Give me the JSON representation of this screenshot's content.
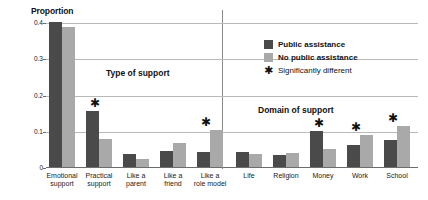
{
  "chart_data": {
    "type": "bar",
    "title": "",
    "xlabel": "",
    "ylabel": "Proportion",
    "ylim": [
      0,
      0.4
    ],
    "yticks": [
      "0",
      "0.1",
      "0.2",
      "0.3",
      "0.4"
    ],
    "ytick_values": [
      0,
      0.1,
      0.2,
      0.3,
      0.4
    ],
    "grid": true,
    "legend_position": "top-right",
    "categories": [
      "Emotional support",
      "Practical support",
      "Like a parent",
      "Like a friend",
      "Like a role model",
      "Life",
      "Religion",
      "Money",
      "Work",
      "School"
    ],
    "category_lines": [
      [
        "Emotional",
        "support"
      ],
      [
        "Practical",
        "support"
      ],
      [
        "Like a",
        "parent"
      ],
      [
        "Like a",
        "friend"
      ],
      [
        "Like a",
        "role model"
      ],
      [
        "Life"
      ],
      [
        "Religion"
      ],
      [
        "Money"
      ],
      [
        "Work"
      ],
      [
        "School"
      ]
    ],
    "series": [
      {
        "name": "Public assistance",
        "color": "#4a4a4a",
        "values": [
          0.4,
          0.155,
          0.035,
          0.045,
          0.042,
          0.042,
          0.033,
          0.098,
          0.06,
          0.075
        ]
      },
      {
        "name": "No public assistance",
        "color": "#a9a9a9",
        "values": [
          0.385,
          0.078,
          0.022,
          0.065,
          0.102,
          0.035,
          0.04,
          0.05,
          0.087,
          0.112
        ]
      }
    ],
    "significant": [
      false,
      true,
      false,
      false,
      true,
      false,
      false,
      true,
      true,
      true
    ],
    "annotations": [
      {
        "text": "Type of support",
        "covers": [
          "Emotional support",
          "Practical support",
          "Like a parent",
          "Like a friend",
          "Like a role model"
        ]
      },
      {
        "text": "Domain of support",
        "covers": [
          "Life",
          "Religion",
          "Money",
          "Work",
          "School"
        ]
      }
    ]
  },
  "legend": {
    "items": [
      {
        "label": "Public assistance",
        "marker": "swatch-dark"
      },
      {
        "label": "No public assistance",
        "marker": "swatch-light"
      },
      {
        "label": "Significantly different",
        "marker": "star-glyph",
        "glyph": "✱"
      }
    ]
  },
  "star_glyph": "✱"
}
